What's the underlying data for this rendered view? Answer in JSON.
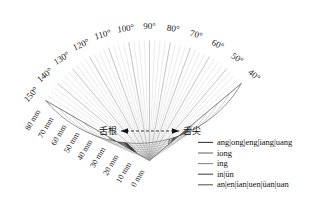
{
  "figure": {
    "type": "polar-tongue-contours",
    "background": "#ffffff"
  },
  "chart_data": {
    "type": "line",
    "title": "",
    "subtitle": "",
    "xlabel": "",
    "ylabel": "",
    "coordinate_system": "polar",
    "grid": true,
    "legend_position": "bottom-right",
    "angular_axis": {
      "unit": "degree",
      "min": 40,
      "max": 150,
      "major_step": 10,
      "minor_step": 5,
      "tick_labels": [
        "40°",
        "50°",
        "60°",
        "70°",
        "80°",
        "90°",
        "100°",
        "110°",
        "120°",
        "130°",
        "140°",
        "150°"
      ]
    },
    "radial_axis": {
      "unit": "mm",
      "min": 0,
      "max": 80,
      "step": 10,
      "tick_labels": [
        "0 mm",
        "10 mm",
        "20 mm",
        "30 mm",
        "40 mm",
        "50 mm",
        "60 mm",
        "70 mm",
        "80 mm"
      ],
      "label_angle_deg": 150
    },
    "annotations": [
      {
        "name": "tongue-root-label",
        "text": "舌根",
        "side": "left"
      },
      {
        "name": "tongue-tip-label",
        "text": "舌尖",
        "side": "right"
      },
      {
        "name": "direction-arrow",
        "text": "↔",
        "style": "double-headed dashed horizontal arrow"
      }
    ],
    "series": [
      {
        "name": "ang|ong|eng|iang|uang",
        "color": "#3a3a3a",
        "contours": [
          [
            [
              150,
              16
            ],
            [
              143,
              26
            ],
            [
              136,
              37
            ],
            [
              128,
              47
            ],
            [
              120,
              55
            ],
            [
              112,
              61
            ],
            [
              104,
              64
            ],
            [
              96,
              64
            ],
            [
              88,
              61
            ],
            [
              80,
              56
            ],
            [
              72,
              50
            ],
            [
              64,
              44
            ],
            [
              56,
              38
            ],
            [
              48,
              33
            ]
          ],
          [
            [
              150,
              18
            ],
            [
              143,
              28
            ],
            [
              136,
              39
            ],
            [
              128,
              49
            ],
            [
              120,
              57
            ],
            [
              112,
              63
            ],
            [
              104,
              66
            ],
            [
              96,
              66
            ],
            [
              88,
              63
            ],
            [
              80,
              58
            ],
            [
              72,
              52
            ],
            [
              64,
              46
            ],
            [
              56,
              40
            ],
            [
              48,
              35
            ]
          ]
        ]
      },
      {
        "name": "iong",
        "color": "#6e6e6e",
        "contours": [
          [
            [
              150,
              20
            ],
            [
              143,
              30
            ],
            [
              136,
              41
            ],
            [
              128,
              51
            ],
            [
              120,
              59
            ],
            [
              112,
              65
            ],
            [
              104,
              68
            ],
            [
              96,
              67
            ],
            [
              88,
              64
            ],
            [
              80,
              59
            ],
            [
              72,
              53
            ],
            [
              64,
              47
            ],
            [
              56,
              41
            ],
            [
              48,
              36
            ]
          ]
        ]
      },
      {
        "name": "ing",
        "color": "#8a8a8a",
        "contours": [
          [
            [
              150,
              22
            ],
            [
              143,
              32
            ],
            [
              136,
              43
            ],
            [
              128,
              53
            ],
            [
              120,
              60
            ],
            [
              112,
              66
            ],
            [
              104,
              69
            ],
            [
              96,
              68
            ],
            [
              88,
              65
            ],
            [
              80,
              60
            ],
            [
              72,
              54
            ],
            [
              64,
              48
            ],
            [
              56,
              42
            ],
            [
              48,
              37
            ]
          ]
        ]
      },
      {
        "name": "in|ün",
        "color": "#4a4a4a",
        "contours": [
          [
            [
              150,
              24
            ],
            [
              143,
              34
            ],
            [
              136,
              44
            ],
            [
              128,
              54
            ],
            [
              120,
              61
            ],
            [
              112,
              66
            ],
            [
              104,
              69
            ],
            [
              96,
              69
            ],
            [
              88,
              66
            ],
            [
              80,
              61
            ],
            [
              72,
              55
            ],
            [
              64,
              49
            ],
            [
              56,
              43
            ],
            [
              48,
              38
            ]
          ]
        ]
      },
      {
        "name": "an|en|ian|uen|üan|uan",
        "color": "#5c5c5c",
        "contours": [
          [
            [
              150,
              26
            ],
            [
              143,
              36
            ],
            [
              136,
              46
            ],
            [
              128,
              55
            ],
            [
              120,
              62
            ],
            [
              112,
              67
            ],
            [
              104,
              70
            ],
            [
              96,
              70
            ],
            [
              88,
              67
            ],
            [
              80,
              62
            ],
            [
              72,
              56
            ],
            [
              64,
              50
            ],
            [
              56,
              44
            ],
            [
              48,
              39
            ]
          ]
        ]
      }
    ]
  },
  "legend": {
    "items": [
      {
        "label": "ang|ong|eng|iang|uang",
        "color": "#3a3a3a"
      },
      {
        "label": "iong",
        "color": "#6e6e6e"
      },
      {
        "label": "ing",
        "color": "#8a8a8a"
      },
      {
        "label": "in|ün",
        "color": "#4a4a4a"
      },
      {
        "label": "an|en|ian|uen|üan|uan",
        "color": "#5c5c5c"
      }
    ]
  }
}
